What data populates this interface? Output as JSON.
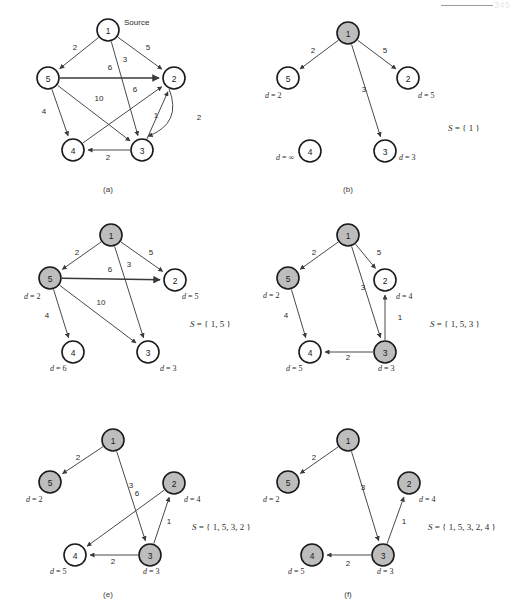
{
  "page": {
    "header_number": "345"
  },
  "figure": {
    "source_label": "Source",
    "panels": [
      {
        "id": "a",
        "caption": "(a)",
        "set_label": null,
        "nodes": [
          {
            "id": "1",
            "x": 108,
            "y": 30,
            "visited": false,
            "d": null
          },
          {
            "id": "5",
            "x": 48,
            "y": 78,
            "visited": false,
            "d": null
          },
          {
            "id": "2",
            "x": 174,
            "y": 78,
            "visited": false,
            "d": null
          },
          {
            "id": "4",
            "x": 73,
            "y": 150,
            "visited": false,
            "d": null
          },
          {
            "id": "3",
            "x": 142,
            "y": 150,
            "visited": false,
            "d": null
          }
        ],
        "edges": [
          {
            "from": "1",
            "to": "5",
            "weight": "2",
            "lx": 75,
            "ly": 50
          },
          {
            "from": "1",
            "to": "2",
            "weight": "5",
            "lx": 148,
            "ly": 50
          },
          {
            "from": "1",
            "to": "3",
            "weight": "3",
            "lx": 125,
            "ly": 62
          },
          {
            "from": "5",
            "to": "2",
            "weight": "6",
            "lx": 110,
            "ly": 70
          },
          {
            "from": "5",
            "to": "4",
            "weight": "4",
            "lx": 44,
            "ly": 114
          },
          {
            "from": "5",
            "to": "3",
            "weight": "10",
            "lx": 99,
            "ly": 101
          },
          {
            "from": "4",
            "to": "2",
            "weight": "6",
            "lx": 135,
            "ly": 92
          },
          {
            "from": "3",
            "to": "2",
            "weight": "1",
            "lx": 156,
            "ly": 118
          },
          {
            "from": "2",
            "to": "3",
            "weight": "2",
            "lx": 199,
            "ly": 120
          },
          {
            "from": "3",
            "to": "4",
            "weight": "2",
            "lx": 108,
            "ly": 160
          }
        ]
      },
      {
        "id": "b",
        "caption": "(b)",
        "set_label": "S  =  { 1 }",
        "nodes": [
          {
            "id": "1",
            "x": 348,
            "y": 33,
            "visited": true,
            "d": null
          },
          {
            "id": "5",
            "x": 288,
            "y": 78,
            "visited": false,
            "d": "2",
            "dx": 265,
            "dy": 98
          },
          {
            "id": "2",
            "x": 408,
            "y": 78,
            "visited": false,
            "d": "5",
            "dx": 418,
            "dy": 98
          },
          {
            "id": "4",
            "x": 310,
            "y": 151,
            "visited": false,
            "d": "∞",
            "dx": 276,
            "dy": 160
          },
          {
            "id": "3",
            "x": 385,
            "y": 151,
            "visited": false,
            "d": "3",
            "dx": 399,
            "dy": 160
          }
        ],
        "edges": [
          {
            "from": "1",
            "to": "5",
            "weight": "2",
            "lx": 313,
            "ly": 53
          },
          {
            "from": "1",
            "to": "2",
            "weight": "5",
            "lx": 385,
            "ly": 53
          },
          {
            "from": "1",
            "to": "3",
            "weight": "3",
            "lx": 364,
            "ly": 92
          }
        ],
        "set_x": 448,
        "set_y": 131
      },
      {
        "id": "c",
        "caption": null,
        "set_label": "S  =  { 1, 5 }",
        "nodes": [
          {
            "id": "1",
            "x": 111,
            "y": 235,
            "visited": true,
            "d": null
          },
          {
            "id": "5",
            "x": 50,
            "y": 278,
            "visited": true,
            "d": "2",
            "dx": 24,
            "dy": 299
          },
          {
            "id": "2",
            "x": 175,
            "y": 280,
            "visited": false,
            "d": "5",
            "dx": 182,
            "dy": 299
          },
          {
            "id": "4",
            "x": 73,
            "y": 352,
            "visited": false,
            "d": "6",
            "dx": 50,
            "dy": 371
          },
          {
            "id": "3",
            "x": 148,
            "y": 352,
            "visited": false,
            "d": "3",
            "dx": 160,
            "dy": 371
          }
        ],
        "edges": [
          {
            "from": "1",
            "to": "5",
            "weight": "2",
            "lx": 77,
            "ly": 255
          },
          {
            "from": "1",
            "to": "2",
            "weight": "5",
            "lx": 151,
            "ly": 255
          },
          {
            "from": "1",
            "to": "3",
            "weight": "3",
            "lx": 129,
            "ly": 267
          },
          {
            "from": "5",
            "to": "2",
            "weight": "6",
            "lx": 110,
            "ly": 272
          },
          {
            "from": "5",
            "to": "4",
            "weight": "4",
            "lx": 47,
            "ly": 318
          },
          {
            "from": "5",
            "to": "3",
            "weight": "10",
            "lx": 101,
            "ly": 305
          }
        ],
        "set_x": 190,
        "set_y": 327
      },
      {
        "id": "d",
        "caption": null,
        "set_label": "S  =  { 1, 5, 3 }",
        "nodes": [
          {
            "id": "1",
            "x": 348,
            "y": 235,
            "visited": true,
            "d": null
          },
          {
            "id": "5",
            "x": 288,
            "y": 278,
            "visited": true,
            "d": "2",
            "dx": 263,
            "dy": 298
          },
          {
            "id": "2",
            "x": 385,
            "y": 280,
            "visited": false,
            "d": "4",
            "dx": 396,
            "dy": 299
          },
          {
            "id": "4",
            "x": 310,
            "y": 352,
            "visited": false,
            "d": "5",
            "dx": 286,
            "dy": 371
          },
          {
            "id": "3",
            "x": 385,
            "y": 352,
            "visited": true,
            "d": "3",
            "dx": 378,
            "dy": 371
          }
        ],
        "edges": [
          {
            "from": "1",
            "to": "5",
            "weight": "2",
            "lx": 314,
            "ly": 255
          },
          {
            "from": "1",
            "to": "2",
            "weight": "5",
            "lx": 379,
            "ly": 255
          },
          {
            "from": "1",
            "to": "3",
            "weight": "3",
            "lx": 363,
            "ly": 290
          },
          {
            "from": "5",
            "to": "4",
            "weight": "4",
            "lx": 286,
            "ly": 318
          },
          {
            "from": "3",
            "to": "2",
            "weight": "1",
            "lx": 400,
            "ly": 320
          },
          {
            "from": "3",
            "to": "4",
            "weight": "2",
            "lx": 348,
            "ly": 360
          }
        ],
        "set_x": 430,
        "set_y": 327
      },
      {
        "id": "e",
        "caption": "(e)",
        "set_label": "S  =  { 1, 5, 3, 2 }",
        "nodes": [
          {
            "id": "1",
            "x": 113,
            "y": 440,
            "visited": true,
            "d": null
          },
          {
            "id": "5",
            "x": 50,
            "y": 482,
            "visited": true,
            "d": "2",
            "dx": 26,
            "dy": 502
          },
          {
            "id": "2",
            "x": 174,
            "y": 483,
            "visited": true,
            "d": "4",
            "dx": 184,
            "dy": 502
          },
          {
            "id": "4",
            "x": 75,
            "y": 555,
            "visited": false,
            "d": "5",
            "dx": 50,
            "dy": 574
          },
          {
            "id": "3",
            "x": 150,
            "y": 555,
            "visited": true,
            "d": "3",
            "dx": 143,
            "dy": 574
          }
        ],
        "edges": [
          {
            "from": "1",
            "to": "5",
            "weight": "2",
            "lx": 78,
            "ly": 460
          },
          {
            "from": "1",
            "to": "3",
            "weight": "3",
            "lx": 131,
            "ly": 488
          },
          {
            "from": "2",
            "to": "4",
            "weight": "6",
            "lx": 137,
            "ly": 496
          },
          {
            "from": "3",
            "to": "2",
            "weight": "1",
            "lx": 169,
            "ly": 524
          },
          {
            "from": "3",
            "to": "4",
            "weight": "2",
            "lx": 113,
            "ly": 564
          }
        ],
        "set_x": 192,
        "set_y": 530
      },
      {
        "id": "f",
        "caption": "(f)",
        "set_label": "S  =  { 1, 5, 3, 2, 4 }",
        "nodes": [
          {
            "id": "1",
            "x": 348,
            "y": 440,
            "visited": true,
            "d": null
          },
          {
            "id": "5",
            "x": 288,
            "y": 482,
            "visited": true,
            "d": "2",
            "dx": 263,
            "dy": 502
          },
          {
            "id": "2",
            "x": 409,
            "y": 483,
            "visited": true,
            "d": "4",
            "dx": 419,
            "dy": 502
          },
          {
            "id": "4",
            "x": 312,
            "y": 555,
            "visited": true,
            "d": "5",
            "dx": 288,
            "dy": 574
          },
          {
            "id": "3",
            "x": 383,
            "y": 555,
            "visited": true,
            "d": "3",
            "dx": 377,
            "dy": 574
          }
        ],
        "edges": [
          {
            "from": "1",
            "to": "5",
            "weight": "2",
            "lx": 314,
            "ly": 460
          },
          {
            "from": "1",
            "to": "3",
            "weight": "3",
            "lx": 363,
            "ly": 490
          },
          {
            "from": "3",
            "to": "2",
            "weight": "1",
            "lx": 404,
            "ly": 524
          },
          {
            "from": "3",
            "to": "4",
            "weight": "2",
            "lx": 348,
            "ly": 566
          }
        ],
        "set_x": 428,
        "set_y": 530
      }
    ]
  },
  "colors": {
    "node_fill_unvisited": "#ffffff",
    "node_fill_visited": "#bdbdbd",
    "node_stroke": "#1a1a1a",
    "edge": "#4a4a4a",
    "text": "#2b2b2b"
  },
  "geometry": {
    "node_radius": 11
  }
}
